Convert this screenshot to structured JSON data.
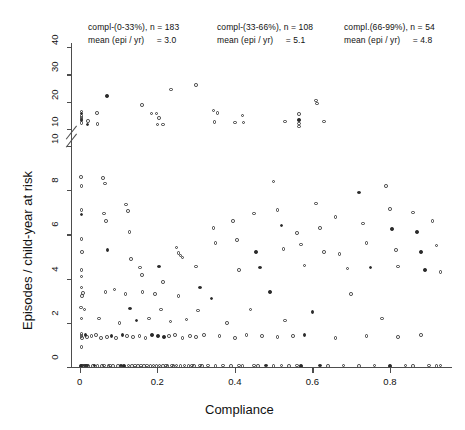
{
  "figure": {
    "background": "#ffffff",
    "marker_color": "#3a3a3a",
    "axis_color": "#4d4d4d"
  },
  "annotations": [
    {
      "name": "stratum-low",
      "group": "compl-(0-33%), n = 183",
      "mean_label": "mean (epi / yr)",
      "mean_value": "= 3.0"
    },
    {
      "name": "stratum-mid",
      "group": "compl-(33-66%), n = 108",
      "mean_label": "mean (epi / yr)",
      "mean_value": "= 5.1"
    },
    {
      "name": "stratum-high",
      "group": "compl.(66-99%), n = 54",
      "mean_label": "mean (epi / yr)",
      "mean_value": "= 4.8"
    }
  ],
  "chart_data": {
    "type": "scatter",
    "title": "",
    "xlabel": "Compliance",
    "ylabel": "Episodes / child-year at risk",
    "grid": false,
    "legend": "none",
    "broken_axis": true,
    "xlim": [
      -0.02,
      0.96
    ],
    "xticks": [
      0,
      0.2,
      0.4,
      0.6,
      0.8
    ],
    "xticklabels": [
      "0",
      "0.2",
      "0.4",
      "0.6",
      "0.8"
    ],
    "ylim_lower": [
      0,
      10
    ],
    "yticks_lower": [
      0,
      2,
      4,
      6,
      8,
      10
    ],
    "yticklabels_lower": [
      "0",
      "2",
      "4",
      "6",
      "8",
      "10"
    ],
    "ylim_upper": [
      10,
      44
    ],
    "yticks_upper": [
      10,
      20,
      30,
      40
    ],
    "yticklabels_upper": [
      "10",
      "20",
      "30",
      "40"
    ],
    "n_total": 345,
    "strata": [
      {
        "range": "0-33%",
        "n": 183,
        "mean_episodes_per_year": 3.0
      },
      {
        "range": "33-66%",
        "n": 108,
        "mean_episodes_per_year": 5.1
      },
      {
        "range": "66-99%",
        "n": 54,
        "mean_episodes_per_year": 4.8
      }
    ],
    "points_upper": [
      [
        0.005,
        13.2
      ],
      [
        0.005,
        14.0
      ],
      [
        0.005,
        14.8
      ],
      [
        0.005,
        15.6
      ],
      [
        0.005,
        16.4
      ],
      [
        0.005,
        12.2
      ],
      [
        0.022,
        13.0
      ],
      [
        0.02,
        11.6
      ],
      [
        0.045,
        15.9
      ],
      [
        0.046,
        11.8
      ],
      [
        0.07,
        22.0
      ],
      [
        0.16,
        18.8
      ],
      [
        0.185,
        15.6
      ],
      [
        0.198,
        15.7
      ],
      [
        0.2,
        11.7
      ],
      [
        0.205,
        14.0
      ],
      [
        0.215,
        11.6
      ],
      [
        0.235,
        24.5
      ],
      [
        0.3,
        26.1
      ],
      [
        0.345,
        16.7
      ],
      [
        0.355,
        15.9
      ],
      [
        0.348,
        12.6
      ],
      [
        0.4,
        12.4
      ],
      [
        0.42,
        14.9
      ],
      [
        0.422,
        12.4
      ],
      [
        0.53,
        12.7
      ],
      [
        0.565,
        15.5
      ],
      [
        0.565,
        13.2
      ],
      [
        0.565,
        12.0
      ],
      [
        0.565,
        10.9
      ],
      [
        0.61,
        20.5
      ],
      [
        0.612,
        19.3
      ],
      [
        0.63,
        12.7
      ]
    ],
    "points_lower": [
      [
        0.003,
        8.6
      ],
      [
        0.004,
        8.2
      ],
      [
        0.004,
        7.1
      ],
      [
        0.005,
        6.9
      ],
      [
        0.004,
        5.8
      ],
      [
        0.006,
        5.2
      ],
      [
        0.004,
        4.4
      ],
      [
        0.005,
        4.1
      ],
      [
        0.004,
        3.6
      ],
      [
        0.006,
        3.2
      ],
      [
        0.003,
        2.7
      ],
      [
        0.004,
        2.2
      ],
      [
        0.004,
        1.5
      ],
      [
        0.005,
        1.4
      ],
      [
        0.006,
        1.3
      ],
      [
        0.004,
        0.9
      ],
      [
        0.003,
        0.05
      ],
      [
        0.006,
        0.06
      ],
      [
        0.01,
        0.05
      ],
      [
        0.013,
        0.07
      ],
      [
        0.016,
        0.05
      ],
      [
        0.019,
        0.06
      ],
      [
        0.022,
        0.05
      ],
      [
        0.008,
        3.35
      ],
      [
        0.012,
        2.6
      ],
      [
        0.015,
        1.45
      ],
      [
        0.018,
        1.35
      ],
      [
        0.03,
        1.4
      ],
      [
        0.034,
        0.05
      ],
      [
        0.038,
        0.06
      ],
      [
        0.042,
        1.45
      ],
      [
        0.046,
        0.05
      ],
      [
        0.05,
        2.2
      ],
      [
        0.055,
        1.3
      ],
      [
        0.058,
        0.05
      ],
      [
        0.062,
        0.06
      ],
      [
        0.066,
        3.4
      ],
      [
        0.07,
        1.35
      ],
      [
        0.074,
        0.05
      ],
      [
        0.078,
        0.06
      ],
      [
        0.082,
        1.4
      ],
      [
        0.086,
        0.05
      ],
      [
        0.09,
        3.5
      ],
      [
        0.094,
        1.3
      ],
      [
        0.098,
        0.05
      ],
      [
        0.102,
        2.0
      ],
      [
        0.106,
        0.06
      ],
      [
        0.11,
        1.45
      ],
      [
        0.114,
        0.05
      ],
      [
        0.118,
        3.3
      ],
      [
        0.122,
        1.4
      ],
      [
        0.126,
        0.06
      ],
      [
        0.13,
        2.65
      ],
      [
        0.134,
        0.05
      ],
      [
        0.138,
        1.35
      ],
      [
        0.142,
        0.06
      ],
      [
        0.146,
        2.1
      ],
      [
        0.15,
        0.05
      ],
      [
        0.154,
        1.4
      ],
      [
        0.158,
        0.06
      ],
      [
        0.162,
        3.4
      ],
      [
        0.166,
        0.05
      ],
      [
        0.17,
        1.3
      ],
      [
        0.174,
        0.06
      ],
      [
        0.178,
        2.2
      ],
      [
        0.182,
        0.05
      ],
      [
        0.186,
        1.45
      ],
      [
        0.19,
        0.06
      ],
      [
        0.194,
        3.3
      ],
      [
        0.198,
        0.05
      ],
      [
        0.202,
        1.4
      ],
      [
        0.206,
        0.06
      ],
      [
        0.21,
        2.6
      ],
      [
        0.214,
        0.05
      ],
      [
        0.218,
        1.35
      ],
      [
        0.222,
        0.06
      ],
      [
        0.226,
        0.05
      ],
      [
        0.23,
        1.4
      ],
      [
        0.234,
        2.05
      ],
      [
        0.238,
        0.06
      ],
      [
        0.242,
        0.05
      ],
      [
        0.246,
        1.45
      ],
      [
        0.25,
        0.06
      ],
      [
        0.255,
        3.2
      ],
      [
        0.26,
        0.05
      ],
      [
        0.265,
        1.3
      ],
      [
        0.27,
        0.06
      ],
      [
        0.275,
        2.15
      ],
      [
        0.28,
        0.05
      ],
      [
        0.285,
        1.4
      ],
      [
        0.29,
        0.06
      ],
      [
        0.295,
        0.05
      ],
      [
        0.3,
        1.35
      ],
      [
        0.305,
        2.55
      ],
      [
        0.31,
        0.06
      ],
      [
        0.315,
        0.05
      ],
      [
        0.32,
        1.45
      ],
      [
        0.33,
        0.06
      ],
      [
        0.34,
        3.1
      ],
      [
        0.35,
        0.05
      ],
      [
        0.36,
        1.4
      ],
      [
        0.37,
        0.06
      ],
      [
        0.38,
        2.0
      ],
      [
        0.39,
        0.05
      ],
      [
        0.4,
        1.3
      ],
      [
        0.41,
        0.06
      ],
      [
        0.42,
        0.05
      ],
      [
        0.43,
        1.45
      ],
      [
        0.44,
        2.6
      ],
      [
        0.45,
        0.06
      ],
      [
        0.46,
        0.05
      ],
      [
        0.47,
        1.4
      ],
      [
        0.48,
        0.06
      ],
      [
        0.49,
        3.4
      ],
      [
        0.5,
        0.05
      ],
      [
        0.51,
        1.35
      ],
      [
        0.52,
        0.06
      ],
      [
        0.53,
        2.1
      ],
      [
        0.54,
        0.05
      ],
      [
        0.55,
        1.4
      ],
      [
        0.56,
        0.06
      ],
      [
        0.57,
        0.05
      ],
      [
        0.58,
        1.45
      ],
      [
        0.6,
        2.5
      ],
      [
        0.62,
        0.06
      ],
      [
        0.64,
        0.05
      ],
      [
        0.66,
        1.3
      ],
      [
        0.68,
        0.06
      ],
      [
        0.7,
        3.3
      ],
      [
        0.72,
        0.05
      ],
      [
        0.74,
        1.4
      ],
      [
        0.76,
        0.06
      ],
      [
        0.78,
        2.2
      ],
      [
        0.8,
        0.05
      ],
      [
        0.82,
        1.35
      ],
      [
        0.84,
        0.06
      ],
      [
        0.86,
        0.05
      ],
      [
        0.88,
        1.45
      ],
      [
        0.9,
        0.06
      ],
      [
        0.92,
        0.05
      ],
      [
        0.93,
        0.06
      ],
      [
        0.06,
        8.55
      ],
      [
        0.065,
        8.3
      ],
      [
        0.062,
        6.95
      ],
      [
        0.068,
        6.6
      ],
      [
        0.072,
        5.3
      ],
      [
        0.12,
        7.35
      ],
      [
        0.125,
        7.05
      ],
      [
        0.128,
        6.1
      ],
      [
        0.132,
        4.9
      ],
      [
        0.155,
        4.5
      ],
      [
        0.16,
        4.15
      ],
      [
        0.205,
        4.55
      ],
      [
        0.215,
        3.85
      ],
      [
        0.25,
        5.4
      ],
      [
        0.255,
        5.15
      ],
      [
        0.26,
        5.05
      ],
      [
        0.265,
        4.95
      ],
      [
        0.3,
        4.55
      ],
      [
        0.31,
        3.6
      ],
      [
        0.345,
        6.3
      ],
      [
        0.35,
        5.6
      ],
      [
        0.395,
        6.6
      ],
      [
        0.405,
        5.75
      ],
      [
        0.41,
        4.4
      ],
      [
        0.45,
        6.95
      ],
      [
        0.455,
        5.2
      ],
      [
        0.465,
        4.5
      ],
      [
        0.5,
        8.4
      ],
      [
        0.51,
        7.1
      ],
      [
        0.52,
        6.4
      ],
      [
        0.525,
        5.35
      ],
      [
        0.56,
        6.05
      ],
      [
        0.57,
        5.55
      ],
      [
        0.58,
        4.6
      ],
      [
        0.61,
        7.4
      ],
      [
        0.62,
        6.3
      ],
      [
        0.63,
        5.2
      ],
      [
        0.66,
        6.8
      ],
      [
        0.67,
        5.1
      ],
      [
        0.69,
        4.45
      ],
      [
        0.72,
        7.9
      ],
      [
        0.73,
        6.5
      ],
      [
        0.74,
        5.6
      ],
      [
        0.75,
        4.5
      ],
      [
        0.79,
        8.2
      ],
      [
        0.8,
        7.15
      ],
      [
        0.805,
        6.25
      ],
      [
        0.815,
        5.3
      ],
      [
        0.82,
        4.55
      ],
      [
        0.86,
        7.0
      ],
      [
        0.87,
        6.1
      ],
      [
        0.88,
        5.2
      ],
      [
        0.89,
        4.4
      ],
      [
        0.91,
        6.6
      ],
      [
        0.92,
        5.5
      ],
      [
        0.93,
        4.3
      ]
    ]
  }
}
